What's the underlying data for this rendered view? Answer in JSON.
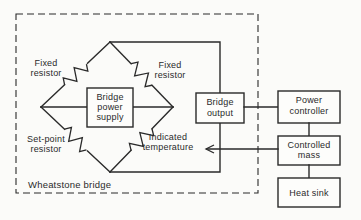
{
  "figure": {
    "type": "block-diagram",
    "ink_color": "#2a2a2a",
    "paper_color": "#fbfbf9",
    "wheatstone_bridge": {
      "caption": "Wheatstone bridge",
      "labels": {
        "fixed_resistor_left": [
          "Fixed",
          "resistor"
        ],
        "fixed_resistor_right": [
          "Fixed",
          "resistor"
        ],
        "set_point_resistor": [
          "Set-point",
          "resistor"
        ],
        "indicated_temperature": [
          "Indicated",
          "temperature"
        ]
      },
      "power_supply_box": [
        "Bridge",
        "power",
        "supply"
      ]
    },
    "blocks": {
      "bridge_output": [
        "Bridge",
        "output"
      ],
      "power_controller": [
        "Power",
        "controller"
      ],
      "controlled_mass": [
        "Controlled",
        "mass"
      ],
      "heat_sink": [
        "Heat sink"
      ]
    }
  }
}
